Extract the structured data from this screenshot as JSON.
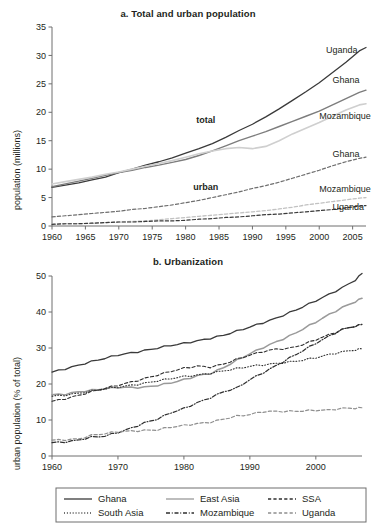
{
  "figure": {
    "panel_a_title": "a. Total and urban population",
    "panel_b_title": "b. Urbanization"
  },
  "chart_data": [
    {
      "type": "line",
      "title": "a. Total and urban population",
      "xlabel": "",
      "ylabel": "population (millions)",
      "xlim": [
        1960,
        2007
      ],
      "ylim": [
        0,
        35
      ],
      "xticks": [
        1960,
        1965,
        1970,
        1975,
        1980,
        1985,
        1990,
        1995,
        2000,
        2005
      ],
      "yticks": [
        0,
        5,
        10,
        15,
        20,
        25,
        30,
        35
      ],
      "grid": false,
      "legend_position": "inline-right-labels",
      "annotations": [
        {
          "text": "total",
          "x": 1983,
          "y": 18.2,
          "bold": true
        },
        {
          "text": "urban",
          "x": 1983,
          "y": 6.3,
          "bold": true
        },
        {
          "text": "Uganda",
          "x": 2001,
          "y": 30.4,
          "series": "Uganda total"
        },
        {
          "text": "Ghana",
          "x": 2002,
          "y": 25.2,
          "series": "Ghana total"
        },
        {
          "text": "Mozambique",
          "x": 2000,
          "y": 18.8,
          "series": "Mozambique total"
        },
        {
          "text": "Ghana",
          "x": 2002,
          "y": 12.2,
          "series": "Ghana urban"
        },
        {
          "text": "Mozambique",
          "x": 2000,
          "y": 5.9,
          "series": "Mozambique urban"
        },
        {
          "text": "Uganda",
          "x": 2002,
          "y": 2.9,
          "series": "Uganda urban"
        }
      ],
      "x": [
        1960,
        1962,
        1964,
        1966,
        1968,
        1970,
        1972,
        1974,
        1976,
        1978,
        1980,
        1982,
        1984,
        1986,
        1988,
        1990,
        1992,
        1994,
        1996,
        1998,
        2000,
        2002,
        2004,
        2006,
        2007
      ],
      "series": [
        {
          "name": "Uganda total",
          "style": "solid",
          "color": "#3a3a3a",
          "width": 1.3,
          "values": [
            6.8,
            7.2,
            7.6,
            8.1,
            8.6,
            9.4,
            10.0,
            10.7,
            11.3,
            12.0,
            12.8,
            13.6,
            14.5,
            15.6,
            16.8,
            17.9,
            19.2,
            20.6,
            22.1,
            23.6,
            25.2,
            27.0,
            28.8,
            30.8,
            31.4
          ]
        },
        {
          "name": "Ghana total",
          "style": "solid",
          "color": "#7d7d7d",
          "width": 1.4,
          "values": [
            6.9,
            7.4,
            7.9,
            8.4,
            8.9,
            9.4,
            9.8,
            10.3,
            10.7,
            11.2,
            11.7,
            12.4,
            13.2,
            14.1,
            15.0,
            15.8,
            16.6,
            17.5,
            18.4,
            19.3,
            20.2,
            21.3,
            22.4,
            23.5,
            23.9
          ]
        },
        {
          "name": "Mozambique total",
          "style": "solid",
          "color": "#cfcfcf",
          "width": 1.6,
          "values": [
            7.4,
            7.8,
            8.2,
            8.6,
            9.1,
            9.5,
            10.0,
            10.5,
            11.0,
            11.5,
            12.1,
            12.7,
            13.2,
            13.6,
            13.8,
            13.6,
            14.0,
            15.0,
            16.2,
            17.2,
            18.2,
            19.3,
            20.4,
            21.3,
            21.5
          ]
        },
        {
          "name": "Ghana urban",
          "style": "dashed",
          "color": "#6e6e6e",
          "width": 1.2,
          "values": [
            1.6,
            1.8,
            2.0,
            2.2,
            2.4,
            2.6,
            2.9,
            3.1,
            3.4,
            3.7,
            4.1,
            4.5,
            5.0,
            5.5,
            6.0,
            6.6,
            7.1,
            7.7,
            8.4,
            9.1,
            9.8,
            10.6,
            11.3,
            11.9,
            12.1
          ]
        },
        {
          "name": "Mozambique urban",
          "style": "dashed",
          "color": "#c2c2c2",
          "width": 1.3,
          "values": [
            0.3,
            0.4,
            0.4,
            0.5,
            0.6,
            0.7,
            0.8,
            0.9,
            1.1,
            1.3,
            1.5,
            1.7,
            1.9,
            2.1,
            2.3,
            2.5,
            2.7,
            3.0,
            3.3,
            3.7,
            4.0,
            4.3,
            4.6,
            4.9,
            5.0
          ]
        },
        {
          "name": "Uganda urban",
          "style": "dashed",
          "color": "#3a3a3a",
          "width": 1.2,
          "values": [
            0.3,
            0.4,
            0.4,
            0.5,
            0.6,
            0.7,
            0.7,
            0.8,
            0.9,
            0.9,
            1.0,
            1.2,
            1.3,
            1.5,
            1.6,
            1.8,
            2.0,
            2.1,
            2.3,
            2.5,
            2.7,
            2.9,
            3.2,
            3.5,
            3.6
          ]
        }
      ]
    },
    {
      "type": "line",
      "title": "b. Urbanization",
      "xlabel": "",
      "ylabel": "urban population (% of total)",
      "xlim": [
        1960,
        2007
      ],
      "ylim": [
        0,
        50
      ],
      "xticks": [
        1960,
        1970,
        1980,
        1990,
        2000
      ],
      "yticks": [
        0,
        10,
        20,
        30,
        40,
        50
      ],
      "grid": false,
      "legend_position": "bottom",
      "x": [
        1960,
        1962,
        1964,
        1966,
        1968,
        1970,
        1972,
        1974,
        1976,
        1978,
        1980,
        1982,
        1984,
        1986,
        1988,
        1990,
        1992,
        1994,
        1996,
        1998,
        2000,
        2002,
        2004,
        2006,
        2007
      ],
      "series": [
        {
          "name": "Ghana",
          "style": "solid",
          "color": "#3a3a3a",
          "width": 1.3,
          "values": [
            23.3,
            24.3,
            25.3,
            26.2,
            27.0,
            28.0,
            28.7,
            29.4,
            30.0,
            30.6,
            31.2,
            32.0,
            32.8,
            33.6,
            34.6,
            35.7,
            37.0,
            38.4,
            39.9,
            41.4,
            43.0,
            44.8,
            46.8,
            49.0,
            50.7
          ]
        },
        {
          "name": "East Asia",
          "style": "solid",
          "color": "#9a9a9a",
          "width": 1.5,
          "values": [
            17.0,
            17.3,
            17.9,
            18.2,
            18.6,
            19.0,
            19.1,
            19.2,
            19.6,
            20.2,
            21.1,
            22.3,
            23.0,
            24.6,
            26.5,
            28.3,
            30.1,
            31.8,
            33.4,
            35.2,
            37.1,
            39.2,
            41.3,
            43.0,
            43.8
          ]
        },
        {
          "name": "SSA",
          "style": "dashed",
          "color": "#2f2f2f",
          "width": 1.1,
          "values": [
            15.2,
            16.0,
            16.9,
            17.8,
            18.7,
            19.6,
            20.6,
            21.6,
            22.5,
            23.4,
            24.3,
            25.0,
            24.8,
            25.6,
            26.8,
            27.9,
            29.0,
            29.8,
            30.0,
            30.9,
            32.2,
            33.6,
            35.2,
            36.2,
            36.6
          ]
        },
        {
          "name": "South Asia",
          "style": "dotted",
          "color": "#2f2f2f",
          "width": 1.1,
          "values": [
            16.6,
            17.0,
            17.5,
            18.0,
            18.5,
            19.1,
            19.7,
            20.3,
            20.9,
            21.4,
            22.0,
            22.5,
            23.1,
            23.7,
            24.2,
            24.8,
            25.3,
            25.8,
            26.2,
            26.6,
            27.2,
            28.1,
            29.0,
            29.6,
            29.8
          ]
        },
        {
          "name": "Mozambique",
          "style": "dashdot",
          "color": "#2f2f2f",
          "width": 1.2,
          "values": [
            3.7,
            4.0,
            4.5,
            5.2,
            5.4,
            6.5,
            7.8,
            9.3,
            10.3,
            11.9,
            13.1,
            14.8,
            16.3,
            17.9,
            18.8,
            21.1,
            23.1,
            25.2,
            27.3,
            29.2,
            31.2,
            33.2,
            35.2,
            36.2,
            36.5
          ]
        },
        {
          "name": "Uganda",
          "style": "dashed",
          "color": "#8f8f8f",
          "width": 1.2,
          "values": [
            4.4,
            4.6,
            4.8,
            5.7,
            6.1,
            6.7,
            7.0,
            7.2,
            7.3,
            7.9,
            8.4,
            9.0,
            9.5,
            10.3,
            11.0,
            11.4,
            12.3,
            12.5,
            12.5,
            12.5,
            12.6,
            12.7,
            13.3,
            13.4,
            13.4
          ]
        }
      ]
    }
  ],
  "panel_a": {
    "title": "a. Total and urban population",
    "y_axis_title": "population (millions)",
    "y_ticks": [
      "0",
      "5",
      "10",
      "15",
      "20",
      "25",
      "30",
      "35"
    ],
    "x_ticks": [
      "1960",
      "1965",
      "1970",
      "1975",
      "1980",
      "1985",
      "1990",
      "1995",
      "2000",
      "2005"
    ],
    "group_labels": {
      "total": "total",
      "urban": "urban"
    },
    "line_labels": {
      "uganda_total": "Uganda",
      "ghana_total": "Ghana",
      "mozambique_total": "Mozambique",
      "ghana_urban": "Ghana",
      "mozambique_urban": "Mozambique",
      "uganda_urban": "Uganda"
    }
  },
  "panel_b": {
    "title": "b. Urbanization",
    "y_axis_title": "urban population (% of total)",
    "y_ticks": [
      "0",
      "10",
      "20",
      "30",
      "40",
      "50"
    ],
    "x_ticks": [
      "1960",
      "1970",
      "1980",
      "1990",
      "2000"
    ],
    "legend": [
      {
        "label": "Ghana",
        "style": "solid",
        "color": "#3a3a3a"
      },
      {
        "label": "East Asia",
        "style": "solid",
        "color": "#9a9a9a"
      },
      {
        "label": "SSA",
        "style": "dashed",
        "color": "#2f2f2f"
      },
      {
        "label": "South Asia",
        "style": "dotted",
        "color": "#2f2f2f"
      },
      {
        "label": "Mozambique",
        "style": "dashdot",
        "color": "#2f2f2f"
      },
      {
        "label": "Uganda",
        "style": "dashed",
        "color": "#8f8f8f"
      }
    ]
  }
}
